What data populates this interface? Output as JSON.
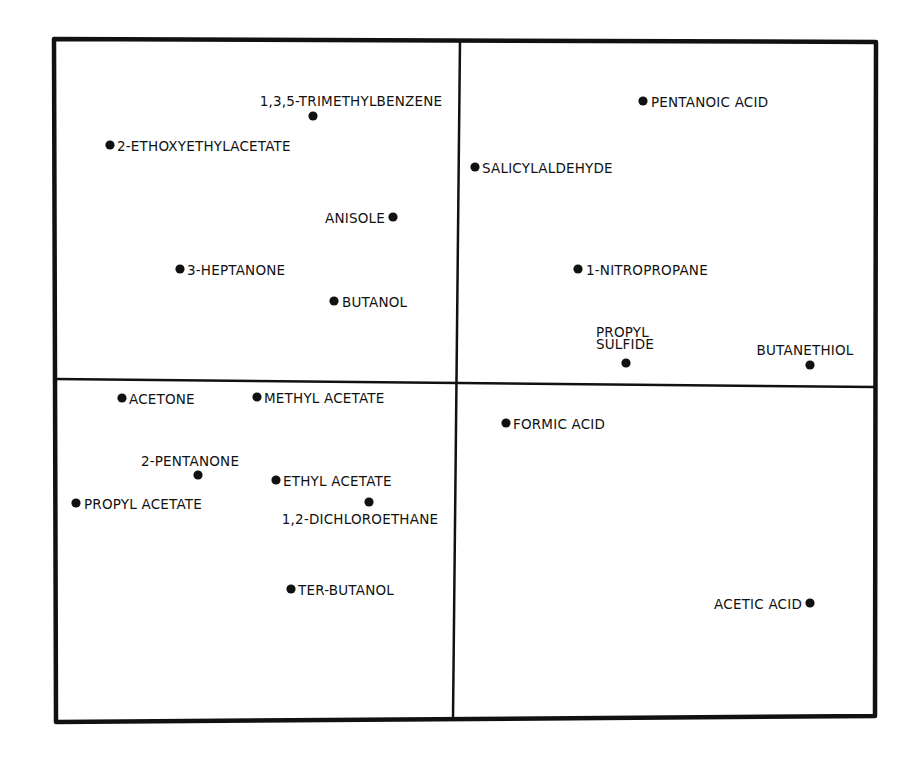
{
  "chart_data": {
    "type": "scatter",
    "title": "",
    "xlabel": "",
    "ylabel": "",
    "grid": false,
    "legend": null,
    "quadrants": true,
    "layout": {
      "frame": {
        "tl": [
          54,
          39
        ],
        "tr": [
          876,
          42
        ],
        "br": [
          875,
          716
        ],
        "bl": [
          56,
          722
        ]
      },
      "vdivider": {
        "top": [
          460,
          40
        ],
        "bottom": [
          453,
          719
        ]
      },
      "hdivider": {
        "left": [
          55,
          379
        ],
        "right": [
          875,
          387
        ]
      }
    },
    "points": [
      {
        "label": "1,3,5-TRIMETHYLBENZENE",
        "x": 313,
        "y": 116,
        "lx": 351,
        "ly": 106,
        "anchor": "middle",
        "quadrant": "upper-left"
      },
      {
        "label": "2-ETHOXYETHYLACETATE",
        "x": 110,
        "y": 145,
        "lx": 117,
        "ly": 151,
        "anchor": "start",
        "quadrant": "upper-left"
      },
      {
        "label": "ANISOLE",
        "x": 393,
        "y": 217,
        "lx": 385,
        "ly": 223,
        "anchor": "end",
        "quadrant": "upper-left"
      },
      {
        "label": "3-HEPTANONE",
        "x": 180,
        "y": 269,
        "lx": 187,
        "ly": 275,
        "anchor": "start",
        "quadrant": "upper-left"
      },
      {
        "label": "BUTANOL",
        "x": 334,
        "y": 301,
        "lx": 342,
        "ly": 307,
        "anchor": "start",
        "quadrant": "upper-left"
      },
      {
        "label": "PENTANOIC ACID",
        "x": 643,
        "y": 101,
        "lx": 651,
        "ly": 107,
        "anchor": "start",
        "quadrant": "upper-right"
      },
      {
        "label": "SALICYLALDEHYDE",
        "x": 475,
        "y": 167,
        "lx": 482,
        "ly": 173,
        "anchor": "start",
        "quadrant": "upper-right"
      },
      {
        "label": "1-NITROPROPANE",
        "x": 578,
        "y": 269,
        "lx": 586,
        "ly": 275,
        "anchor": "start",
        "quadrant": "upper-right"
      },
      {
        "label": "PROPYL SULFIDE",
        "lines": [
          "PROPYL",
          "SULFIDE"
        ],
        "x": 626,
        "y": 363,
        "lx": 596,
        "ly": 337,
        "anchor": "start",
        "quadrant": "upper-right"
      },
      {
        "label": "BUTANETHIOL",
        "x": 810,
        "y": 365,
        "lx": 805,
        "ly": 355,
        "anchor": "middle",
        "quadrant": "upper-right"
      },
      {
        "label": "ACETONE",
        "x": 122,
        "y": 398,
        "lx": 129,
        "ly": 404,
        "anchor": "start",
        "quadrant": "lower-left"
      },
      {
        "label": "METHYL ACETATE",
        "x": 257,
        "y": 397,
        "lx": 264,
        "ly": 403,
        "anchor": "start",
        "quadrant": "lower-left"
      },
      {
        "label": "2-PENTANONE",
        "x": 198,
        "y": 475,
        "lx": 190,
        "ly": 466,
        "anchor": "middle",
        "quadrant": "lower-left"
      },
      {
        "label": "ETHYL ACETATE",
        "x": 276,
        "y": 480,
        "lx": 283,
        "ly": 486,
        "anchor": "start",
        "quadrant": "lower-left"
      },
      {
        "label": "PROPYL ACETATE",
        "x": 76,
        "y": 503,
        "lx": 84,
        "ly": 509,
        "anchor": "start",
        "quadrant": "lower-left"
      },
      {
        "label": "1,2-DICHLOROETHANE",
        "x": 369,
        "y": 502,
        "lx": 360,
        "ly": 524,
        "anchor": "middle",
        "quadrant": "lower-left"
      },
      {
        "label": "TER-BUTANOL",
        "x": 291,
        "y": 589,
        "lx": 298,
        "ly": 595,
        "anchor": "start",
        "quadrant": "lower-left"
      },
      {
        "label": "FORMIC ACID",
        "x": 506,
        "y": 423,
        "lx": 513,
        "ly": 429,
        "anchor": "start",
        "quadrant": "lower-right"
      },
      {
        "label": "ACETIC ACID",
        "x": 810,
        "y": 603,
        "lx": 802,
        "ly": 609,
        "anchor": "end",
        "quadrant": "lower-right"
      }
    ],
    "colors": {
      "ink": "#111111",
      "background": "#ffffff"
    }
  }
}
